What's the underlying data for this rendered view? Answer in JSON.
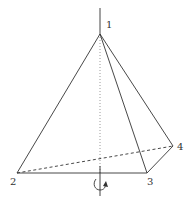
{
  "figure": {
    "vertices": [
      {
        "id": "1",
        "label": "1",
        "x": 100,
        "y": 34
      },
      {
        "id": "2",
        "label": "2",
        "x": 17,
        "y": 173
      },
      {
        "id": "3",
        "label": "3",
        "x": 147,
        "y": 173
      },
      {
        "id": "4",
        "label": "4",
        "x": 173,
        "y": 146
      }
    ],
    "labels": {
      "v1": "1",
      "v2": "2",
      "v3": "3",
      "v4": "4"
    },
    "axis": {
      "x": 100,
      "top_y": 8,
      "bottom_y": 196,
      "rotation_indicator": "counter-clockwise arrow"
    },
    "colors": {
      "line": "#333333",
      "axis_dotted": "#9a9a9a",
      "background": "#ffffff"
    }
  }
}
